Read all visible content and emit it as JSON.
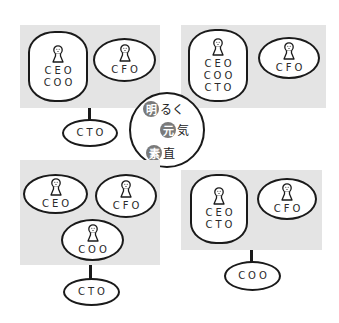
{
  "diagram": {
    "title": "",
    "center": {
      "slogans": [
        {
          "badge": "明",
          "rest": "るく"
        },
        {
          "badge": "元",
          "rest": "気"
        },
        {
          "badge": "素",
          "rest": "直"
        }
      ],
      "badge_color": "#7a7a7a"
    },
    "panels": [
      {
        "position": "top-left",
        "inside": [
          {
            "roles": [
              "CEO",
              "COO"
            ]
          },
          {
            "roles": [
              "CFO"
            ]
          }
        ],
        "below": {
          "roles": [
            "CTO"
          ]
        }
      },
      {
        "position": "top-right",
        "inside": [
          {
            "roles": [
              "CEO",
              "COO",
              "CTO"
            ]
          },
          {
            "roles": [
              "CFO"
            ]
          }
        ],
        "below": null
      },
      {
        "position": "bottom-left",
        "inside": [
          {
            "roles": [
              "CEO"
            ]
          },
          {
            "roles": [
              "CFO"
            ]
          },
          {
            "roles": [
              "COO"
            ]
          }
        ],
        "below": {
          "roles": [
            "CTO"
          ]
        }
      },
      {
        "position": "bottom-right",
        "inside": [
          {
            "roles": [
              "CEO",
              "CTO"
            ]
          },
          {
            "roles": [
              "CFO"
            ]
          }
        ],
        "below": {
          "roles": [
            "COO"
          ]
        }
      }
    ],
    "colors": {
      "panel_bg": "#e4e4e4",
      "stroke": "#1a1a1a"
    }
  }
}
